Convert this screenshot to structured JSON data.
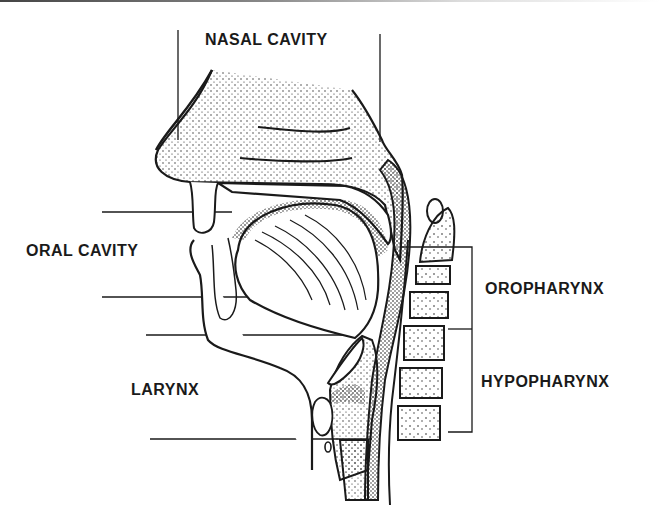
{
  "diagram": {
    "labels": {
      "nasal_cavity": "NASAL CAVITY",
      "oral_cavity": "ORAL CAVITY",
      "oropharynx": "OROPHARYNX",
      "hypopharynx": "HYPOPHARYNX",
      "larynx": "LARYNX"
    },
    "colors": {
      "ink": "#1a1a1a",
      "background": "#ffffff"
    }
  }
}
